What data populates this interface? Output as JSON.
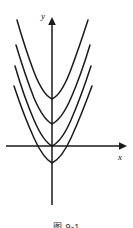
{
  "figure": {
    "caption": "图 9-1",
    "background_color": "#ffffff",
    "stroke_color": "#1a1a1a"
  },
  "axes": {
    "x_label": "x",
    "y_label": "y",
    "origin": {
      "x": 52,
      "y": 146
    },
    "x_axis": {
      "start_x": 6,
      "end_x": 125,
      "y": 146,
      "arrow": "right"
    },
    "y_axis": {
      "x": 52,
      "top_y": 18,
      "bottom_y": 205,
      "arrow": "up"
    },
    "x_label_pos": {
      "x": 120,
      "y": 160
    },
    "y_label_pos": {
      "x": 43,
      "y": 18
    }
  },
  "chart_data": {
    "type": "line",
    "title": "图 9-1",
    "xlabel": "x",
    "ylabel": "y",
    "grid": false,
    "legend": null,
    "axis_origin_px": {
      "x": 52,
      "y": 146
    },
    "x_range_px": [
      6,
      125
    ],
    "y_range_px": [
      18,
      205
    ],
    "series": [
      {
        "name": "parabola-1",
        "vertex_px": {
          "x": 52,
          "y": 99
        },
        "left_top_px": {
          "x": 17,
          "y": 20
        },
        "right_top_px": {
          "x": 88,
          "y": 20
        },
        "path": "M 17 20 Q 25 48 34 72 Q 43 95 52 99 Q 61 95 70 72 Q 79 48 88 20"
      },
      {
        "name": "parabola-2",
        "vertex_px": {
          "x": 52,
          "y": 124
        },
        "left_top_px": {
          "x": 16,
          "y": 45
        },
        "right_top_px": {
          "x": 90,
          "y": 45
        },
        "path": "M 16 45 Q 25 75 34 98 Q 43 119 52 124 Q 62 119 71 98 Q 81 75 90 45"
      },
      {
        "name": "parabola-3",
        "vertex_px": {
          "x": 52,
          "y": 146
        },
        "left_top_px": {
          "x": 15,
          "y": 66
        },
        "right_top_px": {
          "x": 91,
          "y": 66
        },
        "path": "M 15 66 Q 24 97 34 120 Q 43 141 52 146 Q 62 141 71 120 Q 81 97 91 66"
      },
      {
        "name": "parabola-4",
        "vertex_px": {
          "x": 52,
          "y": 163
        },
        "left_top_px": {
          "x": 14,
          "y": 86
        },
        "right_top_px": {
          "x": 92,
          "y": 86
        },
        "path": "M 14 86 Q 24 116 34 138 Q 43 158 52 163 Q 62 158 71 138 Q 81 116 92 86"
      }
    ]
  }
}
